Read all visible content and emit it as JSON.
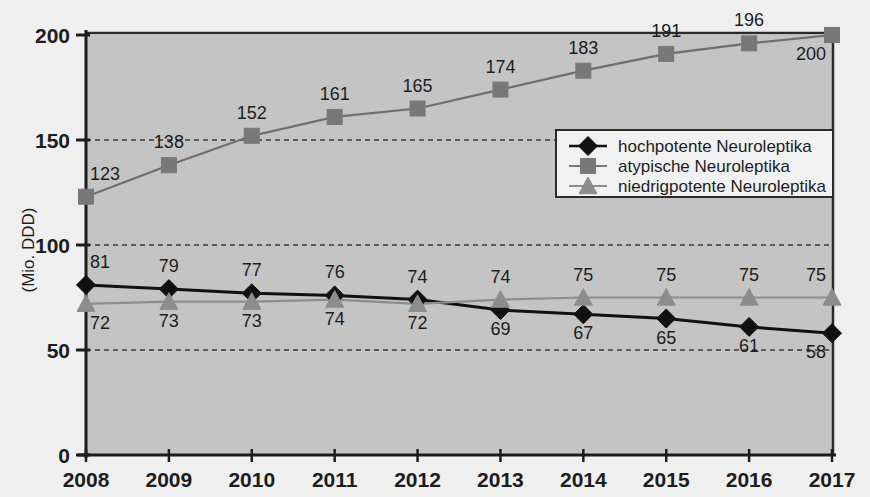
{
  "chart_data": {
    "type": "line",
    "title": "",
    "subtitle": "",
    "xlabel": "",
    "ylabel": "(Mio. DDD)",
    "categories": [
      "2008",
      "2009",
      "2010",
      "2011",
      "2012",
      "2013",
      "2014",
      "2015",
      "2016",
      "2017"
    ],
    "x": [
      2008,
      2009,
      2010,
      2011,
      2012,
      2013,
      2014,
      2015,
      2016,
      2017
    ],
    "xlim": [
      2008,
      2017
    ],
    "ylim": [
      0,
      200
    ],
    "yticks": [
      "0",
      "50",
      "100",
      "150",
      "200"
    ],
    "ytick_values": [
      0,
      50,
      100,
      150,
      200
    ],
    "grid": "horizontal-dashed",
    "legend_position": "upper-right-inside",
    "plot_background": "#c4c4c4",
    "series": [
      {
        "name": "hochpotente Neuroleptika",
        "marker": "diamond",
        "color": "#111111",
        "line_color": "#111111",
        "values": [
          81,
          79,
          77,
          76,
          74,
          69,
          67,
          65,
          61,
          58
        ],
        "label_positions": [
          "above",
          "above",
          "above",
          "above",
          "above",
          "below",
          "below",
          "below",
          "below",
          "below"
        ]
      },
      {
        "name": "atypische Neuroleptika",
        "marker": "square",
        "color": "#787878",
        "line_color": "#6e6e6e",
        "values": [
          123,
          138,
          152,
          161,
          165,
          174,
          183,
          191,
          196,
          200
        ],
        "label_positions": [
          "above",
          "above",
          "above",
          "above",
          "above",
          "above",
          "above",
          "above",
          "above",
          "below"
        ]
      },
      {
        "name": "niedrigpotente Neuroleptika",
        "marker": "triangle",
        "color": "#8d8d8d",
        "line_color": "#8d8d8d",
        "values": [
          72,
          73,
          73,
          74,
          72,
          74,
          75,
          75,
          75,
          75
        ],
        "label_positions": [
          "below",
          "below",
          "below",
          "below",
          "below",
          "above",
          "above",
          "above",
          "above",
          "above"
        ]
      }
    ]
  },
  "legend": {
    "entries": [
      {
        "label": "hochpotente Neuroleptika",
        "marker": "diamond-icon",
        "color": "#111111"
      },
      {
        "label": "atypische Neuroleptika",
        "marker": "square-icon",
        "color": "#787878"
      },
      {
        "label": "niedrigpotente Neuroleptika",
        "marker": "triangle-icon",
        "color": "#8d8d8d"
      }
    ]
  }
}
